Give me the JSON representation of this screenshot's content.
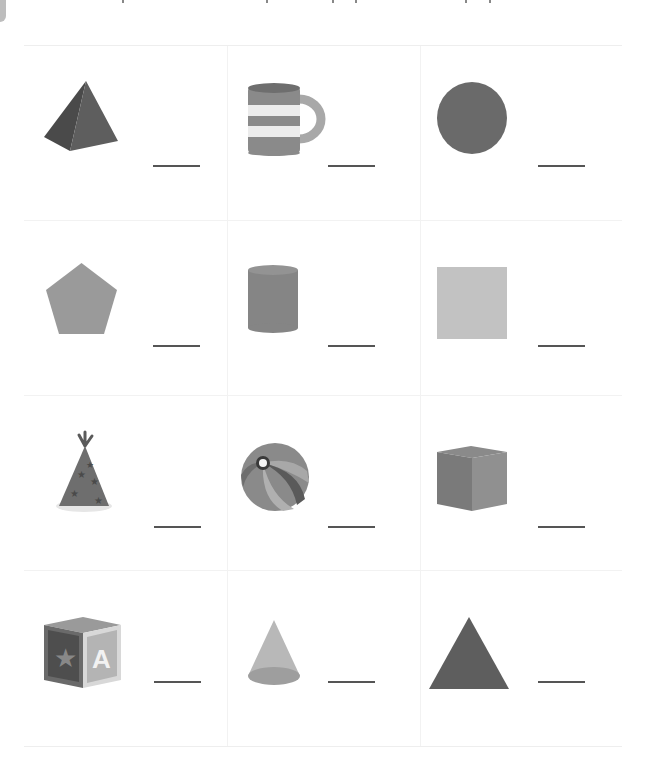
{
  "worksheet": {
    "colors": {
      "dark": "#5a5a5a",
      "medium": "#7a7a7a",
      "light": "#a9a9a9",
      "lighter": "#c4c4c4",
      "line": "#555555"
    },
    "cells": [
      {
        "shape": "pyramid",
        "answer": ""
      },
      {
        "shape": "mug",
        "answer": ""
      },
      {
        "shape": "circle",
        "answer": ""
      },
      {
        "shape": "pentagon",
        "answer": ""
      },
      {
        "shape": "cylinder",
        "answer": ""
      },
      {
        "shape": "square",
        "answer": ""
      },
      {
        "shape": "party-hat",
        "answer": ""
      },
      {
        "shape": "beach-ball",
        "answer": ""
      },
      {
        "shape": "cube",
        "answer": ""
      },
      {
        "shape": "alphabet-block",
        "answer": "",
        "block_letter": "A"
      },
      {
        "shape": "cone",
        "answer": ""
      },
      {
        "shape": "triangle",
        "answer": ""
      }
    ]
  }
}
